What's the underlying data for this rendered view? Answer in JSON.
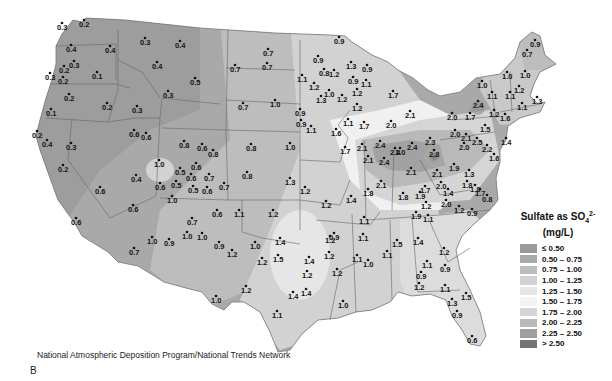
{
  "legend": {
    "title_line1": "Sulfate as SO",
    "title_sub": "4",
    "title_sup": "2-",
    "title_line2": "(mg/L)",
    "classes": [
      {
        "label": "≤ 0.50",
        "color": "#9a9a9a"
      },
      {
        "label": "0.50 – 0.75",
        "color": "#a9a9a9"
      },
      {
        "label": "0.75 – 1.00",
        "color": "#bdbdbd"
      },
      {
        "label": "1.00 – 1.25",
        "color": "#d2d2d2"
      },
      {
        "label": "1.25 – 1.50",
        "color": "#e6e6e6"
      },
      {
        "label": "1.50 – 1.75",
        "color": "#f3f3f3"
      },
      {
        "label": "1.75 – 2.00",
        "color": "#d5d5d5"
      },
      {
        "label": "2.00 – 2.25",
        "color": "#b9b9b9"
      },
      {
        "label": "2.25 – 2.50",
        "color": "#9f9f9f"
      },
      {
        "label": "> 2.50",
        "color": "#747474"
      }
    ]
  },
  "source_credit": "National Atmospheric Deposition Program/National Trends Network",
  "panel_letter": "B",
  "sites": [
    {
      "v": "0.3",
      "x": 62,
      "y": 30
    },
    {
      "v": "0.2",
      "x": 84,
      "y": 27
    },
    {
      "v": "0.4",
      "x": 71,
      "y": 52
    },
    {
      "v": "0.3",
      "x": 74,
      "y": 68
    },
    {
      "v": "0.2",
      "x": 64,
      "y": 73
    },
    {
      "v": "0.3",
      "x": 50,
      "y": 80
    },
    {
      "v": "0.2",
      "x": 63,
      "y": 84
    },
    {
      "v": "0.1",
      "x": 97,
      "y": 79
    },
    {
      "v": "0.2",
      "x": 69,
      "y": 101
    },
    {
      "v": "0.1",
      "x": 51,
      "y": 116
    },
    {
      "v": "0.4",
      "x": 110,
      "y": 53
    },
    {
      "v": "0.2",
      "x": 107,
      "y": 110
    },
    {
      "v": "0.3",
      "x": 137,
      "y": 113
    },
    {
      "v": "0.3",
      "x": 145,
      "y": 45
    },
    {
      "v": "0.4",
      "x": 180,
      "y": 48
    },
    {
      "v": "0.4",
      "x": 157,
      "y": 69
    },
    {
      "v": "0.5",
      "x": 195,
      "y": 85
    },
    {
      "v": "0.3",
      "x": 168,
      "y": 98
    },
    {
      "v": "0.7",
      "x": 235,
      "y": 72
    },
    {
      "v": "0.7",
      "x": 268,
      "y": 56
    },
    {
      "v": "0.7",
      "x": 267,
      "y": 70
    },
    {
      "v": "0.7",
      "x": 243,
      "y": 110
    },
    {
      "v": "1.0",
      "x": 275,
      "y": 107
    },
    {
      "v": "0.9",
      "x": 300,
      "y": 116
    },
    {
      "v": "0.2",
      "x": 37,
      "y": 138
    },
    {
      "v": "0.4",
      "x": 47,
      "y": 147
    },
    {
      "v": "0.3",
      "x": 71,
      "y": 150
    },
    {
      "v": "0.2",
      "x": 63,
      "y": 172
    },
    {
      "v": "0.6",
      "x": 100,
      "y": 194
    },
    {
      "v": "0.6",
      "x": 76,
      "y": 225
    },
    {
      "v": "0.6",
      "x": 146,
      "y": 140
    },
    {
      "v": "0.6",
      "x": 134,
      "y": 137
    },
    {
      "v": "0.4",
      "x": 136,
      "y": 182
    },
    {
      "v": "0.6",
      "x": 133,
      "y": 212
    },
    {
      "v": "0.8",
      "x": 184,
      "y": 148
    },
    {
      "v": "0.6",
      "x": 202,
      "y": 151
    },
    {
      "v": "0.8",
      "x": 213,
      "y": 157
    },
    {
      "v": "1.0",
      "x": 159,
      "y": 167
    },
    {
      "v": "0.6",
      "x": 160,
      "y": 190
    },
    {
      "v": "0.5",
      "x": 180,
      "y": 175
    },
    {
      "v": "0.6",
      "x": 196,
      "y": 170
    },
    {
      "v": "0.6",
      "x": 191,
      "y": 181
    },
    {
      "v": "0.7",
      "x": 209,
      "y": 181
    },
    {
      "v": "0.5",
      "x": 176,
      "y": 188
    },
    {
      "v": "0.5",
      "x": 193,
      "y": 193
    },
    {
      "v": "0.6",
      "x": 207,
      "y": 194
    },
    {
      "v": "0.7",
      "x": 224,
      "y": 190
    },
    {
      "v": "1.0",
      "x": 172,
      "y": 203
    },
    {
      "v": "0.8",
      "x": 251,
      "y": 151
    },
    {
      "v": "0.8",
      "x": 247,
      "y": 179
    },
    {
      "v": "1.0",
      "x": 290,
      "y": 150
    },
    {
      "v": "1.3",
      "x": 290,
      "y": 185
    },
    {
      "v": "1.2",
      "x": 305,
      "y": 194
    },
    {
      "v": "0.7",
      "x": 134,
      "y": 255
    },
    {
      "v": "1.0",
      "x": 187,
      "y": 239
    },
    {
      "v": "0.9",
      "x": 169,
      "y": 246
    },
    {
      "v": "1.0",
      "x": 152,
      "y": 244
    },
    {
      "v": "0.6",
      "x": 217,
      "y": 217
    },
    {
      "v": "0.7",
      "x": 192,
      "y": 225
    },
    {
      "v": "1.1",
      "x": 239,
      "y": 217
    },
    {
      "v": "1.2",
      "x": 273,
      "y": 217
    },
    {
      "v": "1.0",
      "x": 202,
      "y": 240
    },
    {
      "v": "0.9",
      "x": 219,
      "y": 249
    },
    {
      "v": "1.0",
      "x": 255,
      "y": 249
    },
    {
      "v": "1.2",
      "x": 262,
      "y": 265
    },
    {
      "v": "1.2",
      "x": 232,
      "y": 257
    },
    {
      "v": "1.0",
      "x": 216,
      "y": 303
    },
    {
      "v": "1.2",
      "x": 246,
      "y": 293
    },
    {
      "v": "1.4",
      "x": 280,
      "y": 245
    },
    {
      "v": "1.5",
      "x": 278,
      "y": 262
    },
    {
      "v": "1.4",
      "x": 309,
      "y": 264
    },
    {
      "v": "1.2",
      "x": 307,
      "y": 278
    },
    {
      "v": "1.4",
      "x": 293,
      "y": 299
    },
    {
      "v": "1.1",
      "x": 277,
      "y": 318
    },
    {
      "v": "1.2",
      "x": 326,
      "y": 208
    },
    {
      "v": "1.2",
      "x": 330,
      "y": 243
    },
    {
      "v": "0.9",
      "x": 334,
      "y": 240
    },
    {
      "v": "1.2",
      "x": 329,
      "y": 259
    },
    {
      "v": "1.2",
      "x": 337,
      "y": 276
    },
    {
      "v": "1.4",
      "x": 306,
      "y": 296
    },
    {
      "v": "1.0",
      "x": 343,
      "y": 308
    },
    {
      "v": "1.1",
      "x": 364,
      "y": 224
    },
    {
      "v": "1.1",
      "x": 363,
      "y": 241
    },
    {
      "v": "1.1",
      "x": 357,
      "y": 262
    },
    {
      "v": "1.0",
      "x": 368,
      "y": 267
    },
    {
      "v": "1.5",
      "x": 397,
      "y": 247
    },
    {
      "v": "1.1",
      "x": 387,
      "y": 258
    },
    {
      "v": "1.2",
      "x": 419,
      "y": 290
    },
    {
      "v": "0.9",
      "x": 339,
      "y": 44
    },
    {
      "v": "0.9",
      "x": 318,
      "y": 63
    },
    {
      "v": "1.3",
      "x": 351,
      "y": 69
    },
    {
      "v": "0.9",
      "x": 367,
      "y": 72
    },
    {
      "v": "0.8",
      "x": 324,
      "y": 76
    },
    {
      "v": "1.2",
      "x": 334,
      "y": 77
    },
    {
      "v": "1.1",
      "x": 302,
      "y": 82
    },
    {
      "v": "1.2",
      "x": 314,
      "y": 90
    },
    {
      "v": "0.9",
      "x": 353,
      "y": 84
    },
    {
      "v": "1.1",
      "x": 366,
      "y": 87
    },
    {
      "v": "1.0",
      "x": 329,
      "y": 97
    },
    {
      "v": "1.3",
      "x": 321,
      "y": 103
    },
    {
      "v": "1.2",
      "x": 342,
      "y": 102
    },
    {
      "v": "1.2",
      "x": 357,
      "y": 96
    },
    {
      "v": "1.2",
      "x": 357,
      "y": 111
    },
    {
      "v": "0.9",
      "x": 301,
      "y": 127
    },
    {
      "v": "1.1",
      "x": 348,
      "y": 126
    },
    {
      "v": "1.7",
      "x": 393,
      "y": 98
    },
    {
      "v": "1.6",
      "x": 336,
      "y": 136
    },
    {
      "v": "1.7",
      "x": 364,
      "y": 129
    },
    {
      "v": "2.0",
      "x": 391,
      "y": 128
    },
    {
      "v": "2.1",
      "x": 410,
      "y": 118
    },
    {
      "v": "1.1",
      "x": 311,
      "y": 133
    },
    {
      "v": "2.1",
      "x": 362,
      "y": 151
    },
    {
      "v": "1.7",
      "x": 345,
      "y": 154
    },
    {
      "v": "2.4",
      "x": 380,
      "y": 148
    },
    {
      "v": "2.4",
      "x": 395,
      "y": 155
    },
    {
      "v": "2.1",
      "x": 368,
      "y": 163
    },
    {
      "v": "2.4",
      "x": 384,
      "y": 165
    },
    {
      "v": "2.4",
      "x": 412,
      "y": 150
    },
    {
      "v": "2.3",
      "x": 430,
      "y": 145
    },
    {
      "v": "2.8",
      "x": 434,
      "y": 157
    },
    {
      "v": "2.1",
      "x": 411,
      "y": 175
    },
    {
      "v": "2.1",
      "x": 381,
      "y": 188
    },
    {
      "v": "1.8",
      "x": 368,
      "y": 196
    },
    {
      "v": "1.4",
      "x": 351,
      "y": 203
    },
    {
      "v": "1.8",
      "x": 403,
      "y": 200
    },
    {
      "v": "1.7",
      "x": 425,
      "y": 193
    },
    {
      "v": "1.9",
      "x": 420,
      "y": 199
    },
    {
      "v": "2.1",
      "x": 437,
      "y": 177
    },
    {
      "v": "2.0",
      "x": 441,
      "y": 189
    },
    {
      "v": "1.4",
      "x": 448,
      "y": 196
    },
    {
      "v": "1.9",
      "x": 454,
      "y": 171
    },
    {
      "v": "1.2",
      "x": 426,
      "y": 209
    },
    {
      "v": "1.9",
      "x": 416,
      "y": 219
    },
    {
      "v": "1.1",
      "x": 428,
      "y": 222
    },
    {
      "v": "2.0",
      "x": 446,
      "y": 207
    },
    {
      "v": "1.2",
      "x": 459,
      "y": 213
    },
    {
      "v": "0.9",
      "x": 472,
      "y": 216
    },
    {
      "v": "0.8",
      "x": 487,
      "y": 202
    },
    {
      "v": "1.8",
      "x": 475,
      "y": 192
    },
    {
      "v": "1.7",
      "x": 480,
      "y": 196
    },
    {
      "v": "1.3",
      "x": 469,
      "y": 177
    },
    {
      "v": "1.8",
      "x": 467,
      "y": 188
    },
    {
      "v": "2.0",
      "x": 455,
      "y": 137
    },
    {
      "v": "2.1",
      "x": 466,
      "y": 141
    },
    {
      "v": "2.0",
      "x": 464,
      "y": 150
    },
    {
      "v": "2.5",
      "x": 477,
      "y": 145
    },
    {
      "v": "2.2",
      "x": 487,
      "y": 152
    },
    {
      "v": "1.6",
      "x": 494,
      "y": 161
    },
    {
      "v": "2.4",
      "x": 478,
      "y": 108
    },
    {
      "v": "1.7",
      "x": 470,
      "y": 120
    },
    {
      "v": "2.0",
      "x": 452,
      "y": 120
    },
    {
      "v": "1.5",
      "x": 485,
      "y": 132
    },
    {
      "v": "1.2",
      "x": 494,
      "y": 117
    },
    {
      "v": "1.6",
      "x": 505,
      "y": 121
    },
    {
      "v": "1.4",
      "x": 506,
      "y": 145
    },
    {
      "v": "1.0",
      "x": 482,
      "y": 88
    },
    {
      "v": "1.1",
      "x": 492,
      "y": 99
    },
    {
      "v": "1.0",
      "x": 507,
      "y": 79
    },
    {
      "v": "1.1",
      "x": 510,
      "y": 99
    },
    {
      "v": "1.2",
      "x": 519,
      "y": 93
    },
    {
      "v": "1.0",
      "x": 525,
      "y": 78
    },
    {
      "v": "1.1",
      "x": 522,
      "y": 110
    },
    {
      "v": "1.3",
      "x": 537,
      "y": 104
    },
    {
      "v": "0.7",
      "x": 527,
      "y": 57
    },
    {
      "v": "0.9",
      "x": 535,
      "y": 47
    },
    {
      "v": "1.4",
      "x": 418,
      "y": 245
    },
    {
      "v": "1.2",
      "x": 444,
      "y": 255
    },
    {
      "v": "1.1",
      "x": 427,
      "y": 268
    },
    {
      "v": "0.9",
      "x": 445,
      "y": 272
    },
    {
      "v": "0.9",
      "x": 421,
      "y": 279
    },
    {
      "v": "1.1",
      "x": 445,
      "y": 292
    },
    {
      "v": "1.3",
      "x": 452,
      "y": 306
    },
    {
      "v": "1.5",
      "x": 466,
      "y": 300
    },
    {
      "v": "0.9",
      "x": 457,
      "y": 318
    },
    {
      "v": "0.6",
      "x": 472,
      "y": 343
    },
    {
      "v": "1.0",
      "x": 400,
      "y": 155
    }
  ]
}
